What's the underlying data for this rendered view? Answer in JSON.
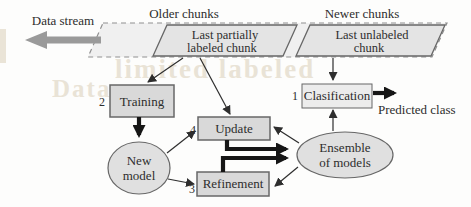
{
  "stream": {
    "data_stream_label": "Data stream",
    "older_chunks_label": "Older chunks",
    "newer_chunks_label": "Newer chunks",
    "last_partially_labeled_chunk": {
      "line1": "Last partially",
      "line2": "labeled chunk"
    },
    "last_unlabeled_chunk": {
      "line1": "Last unlabeled",
      "line2": "chunk"
    }
  },
  "nodes": {
    "training": {
      "number": "2",
      "label": "Training"
    },
    "clasification": {
      "number": "1",
      "label": "Clasification"
    },
    "update": {
      "number": "4",
      "label": "Update"
    },
    "refinement": {
      "number": "3",
      "label": "Refinement"
    },
    "new_model": {
      "line1": "New",
      "line2": "model"
    },
    "ensemble_of_models": {
      "line1": "Ensemble",
      "line2": "of models"
    }
  },
  "output": {
    "predicted_class_label": "Predicted class"
  },
  "bleed_through_text": {
    "fragment1": "limited labeled",
    "fragment2": "Data"
  },
  "colors": {
    "node_fill": "#d9d9d9",
    "node_border": "#676767",
    "chunk_fill": "#e4e4e4",
    "band_fill": "#f0f0f0",
    "band_border": "#909090",
    "light_box_fill": "#ececec",
    "ellipse_fill": "#e0e0e0",
    "arrow": "#2e2e2e",
    "thick_arrow": "#161616",
    "stream_arrow": "#9a9a9a",
    "text": "#2d2d2d",
    "bleed": "#cfc0a4"
  }
}
